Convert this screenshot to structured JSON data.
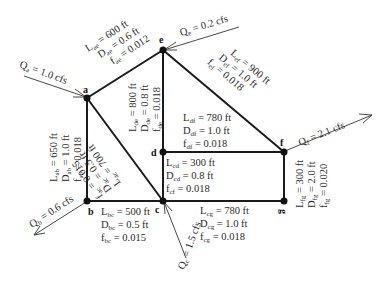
{
  "nodes": {
    "a": {
      "label": "a"
    },
    "b": {
      "label": "b"
    },
    "c": {
      "label": "c"
    },
    "d": {
      "label": "d"
    },
    "e": {
      "label": "e"
    },
    "f": {
      "label": "f"
    },
    "g": {
      "label": "g"
    }
  },
  "flows": {
    "a": {
      "name": "Q",
      "sub": "a",
      "value": " = 1.0 cfs",
      "direction": "in"
    },
    "e": {
      "name": "Q",
      "sub": "e",
      "value": " = 0.2 cfs",
      "direction": "in"
    },
    "b": {
      "name": "Q",
      "sub": "b",
      "value": " = 0.6 cfs",
      "direction": "out"
    },
    "c": {
      "name": "Q",
      "sub": "c",
      "value": " = 1.5 cfs",
      "direction": "in"
    },
    "f": {
      "name": "Q",
      "sub": "f",
      "value": " = 2.1 cfs",
      "direction": "out"
    }
  },
  "pipes": {
    "ae": {
      "L_sub": "ae",
      "L": " = 600 ft",
      "D_sub": "ae",
      "D": " = 0.6 ft",
      "f_sub": "ae",
      "f": " = 0.012"
    },
    "ab": {
      "L_sub": "ab",
      "L": " = 650 ft",
      "D_sub": "ab",
      "D": " = 1.0 ft",
      "f_sub": "ab",
      "f": " = 0.018"
    },
    "ac": {
      "L_sub": "ac",
      "L": " = 700 ft",
      "D_sub": "ac",
      "D": " = 0.5 ft",
      "f_sub": "ac",
      "f": " = 0.015"
    },
    "de": {
      "L_sub": "de",
      "L": " = 800 ft",
      "D_sub": "de",
      "D": " = 0.8 ft",
      "f_sub": "de",
      "f": " = 0.018"
    },
    "ef": {
      "L_sub": "ef",
      "L": " = 900 ft",
      "D_sub": "ef",
      "D": " = 1.0 ft",
      "f_sub": "ef",
      "f": " = 0.018"
    },
    "df": {
      "L_sub": "df",
      "L": " = 780 ft",
      "D_sub": "df",
      "D": " = 1.0 ft",
      "f_sub": "df",
      "f": " = 0.018"
    },
    "cd": {
      "L_sub": "cd",
      "L": " = 300 ft",
      "D_sub": "cd",
      "D": " = 0.8 ft",
      "f_sub": "cf",
      "f": " = 0.018"
    },
    "bc": {
      "L_sub": "bc",
      "L": " = 500 ft",
      "D_sub": "bc",
      "D": " = 0.5 ft",
      "f_sub": "bc",
      "f": " = 0.015"
    },
    "cg": {
      "L_sub": "cg",
      "L": " = 780 ft",
      "D_sub": "cg",
      "D": " = 1.0 ft",
      "f_sub": "cg",
      "f": " = 0.018"
    },
    "fg": {
      "L_sub": "fg",
      "L": " = 300 ft",
      "D_sub": "fg",
      "D": " = 2.0 ft",
      "f_sub": "fg",
      "f": " = 0.020"
    }
  },
  "symbols": {
    "L": "L",
    "D": "D",
    "f": "f"
  }
}
